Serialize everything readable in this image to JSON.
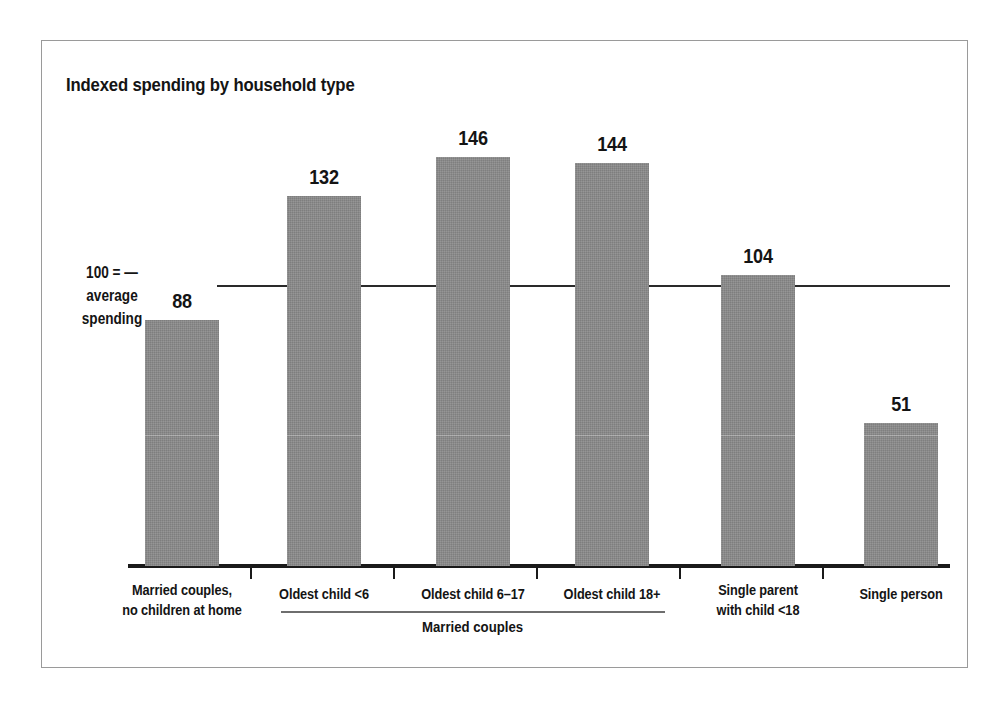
{
  "figure": {
    "title": "Indexed spending by household type",
    "frame_color": "#9a9a9a",
    "bar_color": "#8a8a8a",
    "axis_color": "#1a1a1a"
  },
  "axis_note": {
    "line1": "100 = —",
    "line2": "average",
    "line3": "spending"
  },
  "group_bracket": {
    "label": "Married couples"
  },
  "chart_data": {
    "type": "bar",
    "title": "Indexed spending by household type",
    "xlabel": "",
    "ylabel": "Indexed spending (100 = average spending)",
    "ylim": [
      0,
      160
    ],
    "grid": false,
    "legend": "none",
    "reference_line": {
      "value": 100,
      "label": "100 = average spending"
    },
    "categories": [
      "Married couples, no children at home",
      "Oldest child <6",
      "Oldest child 6–17",
      "Oldest child 18+",
      "Single parent with child <18",
      "Single person"
    ],
    "category_label_lines": [
      [
        "Married couples,",
        "no children at home"
      ],
      [
        "Oldest child <6"
      ],
      [
        "Oldest child 6–17"
      ],
      [
        "Oldest child 18+"
      ],
      [
        "Single parent",
        "with child <18"
      ],
      [
        "Single person"
      ]
    ],
    "values": [
      88,
      132,
      146,
      144,
      104,
      51
    ],
    "value_labels": [
      "88",
      "132",
      "146",
      "144",
      "104",
      "51"
    ],
    "groups": [
      {
        "label": "Married couples",
        "category_indices": [
          1,
          2,
          3
        ]
      }
    ]
  },
  "geometry": {
    "baseline_y": 566,
    "reference_y": 286,
    "bar_width": 74,
    "bar_left_x": [
      145,
      287,
      436,
      575,
      721,
      864
    ],
    "px_per_unit": 2.8,
    "tick_x": [
      250,
      393,
      536,
      679,
      822
    ],
    "label_center_x": [
      182,
      324,
      473,
      612,
      758,
      901
    ],
    "label_top_y": [
      580,
      584,
      584,
      584,
      580,
      584
    ]
  }
}
